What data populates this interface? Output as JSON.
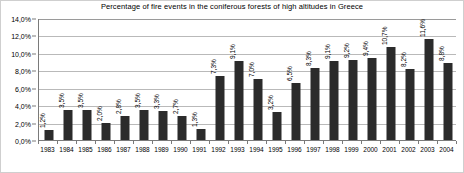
{
  "chart_data": {
    "type": "bar",
    "title": "Percentage of fire events in the coniferous forests of high altitudes in Greece",
    "xlabel": "",
    "ylabel": "",
    "ylim": [
      0,
      14
    ],
    "ytick_step": 2,
    "ytick_labels": [
      "0,0%",
      "2,0%",
      "4,0%",
      "6,0%",
      "8,0%",
      "10,0%",
      "12,0%",
      "14,0%"
    ],
    "ytick_values": [
      0,
      2,
      4,
      6,
      8,
      10,
      12,
      14
    ],
    "grid": true,
    "legend": false,
    "bar_color": "#2b2b2b",
    "categories": [
      "1983",
      "1984",
      "1985",
      "1986",
      "1987",
      "1988",
      "1989",
      "1990",
      "1991",
      "1992",
      "1993",
      "1994",
      "1995",
      "1996",
      "1997",
      "1998",
      "1999",
      "2000",
      "2001",
      "2002",
      "2003",
      "2004"
    ],
    "values": [
      1.2,
      3.5,
      3.5,
      2.0,
      2.8,
      3.5,
      3.3,
      2.7,
      1.3,
      7.3,
      9.1,
      7.0,
      3.2,
      6.5,
      8.3,
      9.1,
      9.2,
      9.4,
      10.7,
      8.2,
      11.6,
      8.8
    ],
    "value_labels": [
      "1,2%",
      "3,5%",
      "3,5%",
      "2,0%",
      "2,8%",
      "3,5%",
      "3,3%",
      "2,7%",
      "1,3%",
      "7,3%",
      "9,1%",
      "7,0%",
      "3,2%",
      "6,5%",
      "8,3%",
      "9,1%",
      "9,2%",
      "9,4%",
      "10,7%",
      "8,2%",
      "11,6%",
      "8,8%"
    ]
  }
}
